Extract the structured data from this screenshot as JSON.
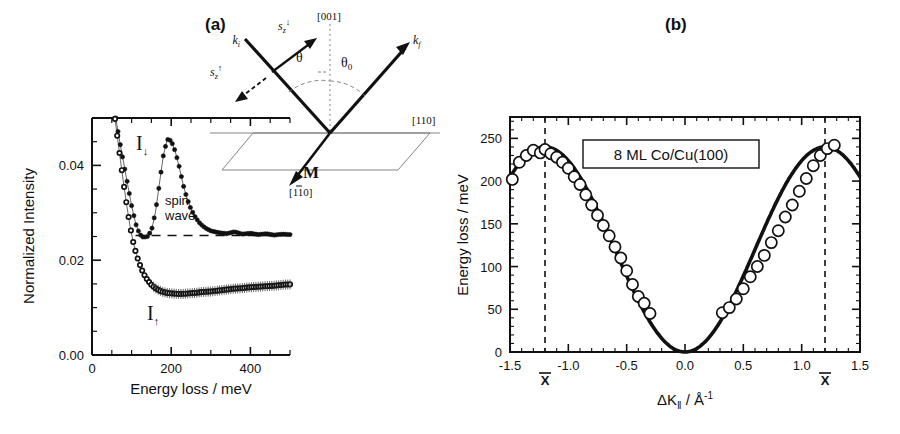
{
  "figure": {
    "panel_a_tag": "(a)",
    "panel_b_tag": "(b)"
  },
  "panel_a": {
    "ylabel": "Normalized Intensity",
    "xlabel": "Energy loss / meV",
    "y_ticks": [
      "0.00",
      "0.02",
      "0.04"
    ],
    "x_ticks": [
      "0",
      "200",
      "400"
    ],
    "annotations": {
      "minority_label": "I",
      "minority_sub": "↓",
      "majority_label": "I",
      "majority_sub": "↑",
      "spin_wave_line1": "spin",
      "spin_wave_line2": "wave"
    },
    "inset": {
      "k_incident": "k",
      "k_incident_sub": "i",
      "k_final": "k",
      "k_final_sub": "f",
      "spin_down": "s",
      "spin_down_sub": "z",
      "spin_down_sup": "↓",
      "spin_up": "s",
      "spin_up_sub": "z",
      "spin_up_sup": "↑",
      "theta": "θ",
      "theta0": "θ",
      "theta0_sub": "0",
      "dir_001": "[001]",
      "dir_110": "[110]",
      "dir_1m10_pre": "[1",
      "dir_1m10_bar": "1",
      "dir_1m10_post": "0]",
      "magnetization": "M"
    }
  },
  "panel_b": {
    "ylabel": "Energy loss / meV",
    "xlabel_delta": "ΔK",
    "xlabel_sub": "‖",
    "xlabel_unit": " / Å",
    "xlabel_unit_sup": "-1",
    "y_ticks": [
      "0",
      "50",
      "100",
      "150",
      "200",
      "250"
    ],
    "x_ticks": [
      "-1.5",
      "-1.0",
      "-0.5",
      "0.0",
      "0.5",
      "1.0",
      "1.5"
    ],
    "legend_text": "8 ML Co/Cu(100)",
    "zone_boundary_label": "X",
    "zone_boundary_positions": [
      -1.2,
      1.2
    ]
  },
  "colors": {
    "ink": "#111111",
    "marker_fill": "#ffffff",
    "filled_marker": "#111111",
    "background": "#ffffff"
  },
  "chart_data": [
    {
      "type": "line",
      "id": "panel-a-speels-spectra",
      "title": "(a) Spin-resolved electron energy loss spectra",
      "xlabel": "Energy loss / meV",
      "ylabel": "Normalized Intensity",
      "xlim": [
        0,
        500
      ],
      "ylim": [
        0.0,
        0.05
      ],
      "xticks": [
        0,
        200,
        400
      ],
      "xminor_step": 50,
      "yticks": [
        0.0,
        0.02,
        0.04
      ],
      "grid": false,
      "legend": "inline-annotations",
      "annotations": [
        {
          "text": "I↓",
          "x": 140,
          "y": 0.0455
        },
        {
          "text": "spin wave",
          "x": 215,
          "y": 0.0345
        },
        {
          "text": "I↑",
          "x": 180,
          "y": 0.0075
        }
      ],
      "reference_line": {
        "type": "dashed-horizontal-baseline",
        "y": 0.0252,
        "x_from": 110,
        "x_to": 500
      },
      "series": [
        {
          "name": "I↓ (minority, filled circles)",
          "marker": "filled-circle",
          "x": [
            60,
            70,
            80,
            90,
            100,
            110,
            120,
            130,
            140,
            150,
            160,
            170,
            180,
            190,
            200,
            210,
            220,
            230,
            240,
            250,
            260,
            270,
            280,
            290,
            300,
            320,
            340,
            360,
            380,
            400,
            420,
            440,
            460,
            480,
            500
          ],
          "y": [
            0.05,
            0.045,
            0.0405,
            0.036,
            0.0315,
            0.0278,
            0.0255,
            0.0248,
            0.025,
            0.0262,
            0.03,
            0.036,
            0.042,
            0.0455,
            0.0452,
            0.043,
            0.0398,
            0.036,
            0.033,
            0.0308,
            0.0292,
            0.028,
            0.0272,
            0.0266,
            0.0262,
            0.0258,
            0.0256,
            0.026,
            0.0255,
            0.0257,
            0.0254,
            0.0256,
            0.0253,
            0.0255,
            0.0254
          ]
        },
        {
          "name": "I↑ (majority, open circles)",
          "marker": "open-circle",
          "x": [
            58,
            65,
            72,
            80,
            88,
            96,
            104,
            112,
            120,
            130,
            140,
            150,
            160,
            170,
            180,
            190,
            200,
            215,
            230,
            245,
            260,
            280,
            300,
            320,
            340,
            360,
            380,
            400,
            420,
            440,
            460,
            480,
            500
          ],
          "y": [
            0.0498,
            0.0455,
            0.041,
            0.036,
            0.0315,
            0.0272,
            0.0238,
            0.0212,
            0.0192,
            0.0172,
            0.0158,
            0.0148,
            0.0141,
            0.0136,
            0.0133,
            0.0131,
            0.013,
            0.0129,
            0.0129,
            0.013,
            0.0131,
            0.0133,
            0.0134,
            0.0136,
            0.0138,
            0.014,
            0.0141,
            0.0143,
            0.0144,
            0.0145,
            0.0146,
            0.0148,
            0.0149
          ]
        }
      ]
    },
    {
      "type": "scatter",
      "id": "panel-b-spin-wave-dispersion",
      "title": "(b) Spin wave dispersion of 8 ML Co/Cu(100)",
      "xlabel": "ΔK‖ / Å⁻¹",
      "ylabel": "Energy loss / meV",
      "xlim": [
        -1.5,
        1.5
      ],
      "ylim": [
        0,
        275
      ],
      "xticks": [
        -1.5,
        -1.0,
        -0.5,
        0.0,
        0.5,
        1.0,
        1.5
      ],
      "yticks": [
        0,
        50,
        100,
        150,
        200,
        250
      ],
      "xminor_step": 0.1,
      "yminor_step": 10,
      "grid": false,
      "vlines": [
        {
          "x": -1.2,
          "style": "dashed",
          "label": "X̄"
        },
        {
          "x": 1.2,
          "style": "dashed",
          "label": "X̄"
        }
      ],
      "fit_curve": {
        "name": "cosine dispersion fit",
        "formula": "E = 120 * (1 - cos(pi * dK / 1.2))",
        "amplitude_mev": 240,
        "zone_boundary_A_inv": 1.2
      },
      "points": {
        "marker": "open-circle",
        "x": [
          -1.48,
          -1.42,
          -1.36,
          -1.3,
          -1.24,
          -1.2,
          -1.15,
          -1.1,
          -1.05,
          -1.0,
          -0.95,
          -0.9,
          -0.85,
          -0.8,
          -0.75,
          -0.7,
          -0.65,
          -0.6,
          -0.55,
          -0.5,
          -0.45,
          -0.4,
          -0.35,
          -0.3,
          0.32,
          0.38,
          0.44,
          0.5,
          0.56,
          0.62,
          0.68,
          0.74,
          0.8,
          0.86,
          0.92,
          0.98,
          1.04,
          1.1,
          1.16,
          1.22,
          1.28
        ],
        "y": [
          202,
          222,
          230,
          236,
          233,
          237,
          232,
          228,
          222,
          215,
          205,
          196,
          184,
          172,
          160,
          148,
          136,
          123,
          110,
          95,
          79,
          65,
          57,
          45,
          46,
          52,
          62,
          74,
          88,
          100,
          113,
          128,
          142,
          158,
          172,
          188,
          203,
          218,
          230,
          238,
          242
        ]
      }
    }
  ]
}
